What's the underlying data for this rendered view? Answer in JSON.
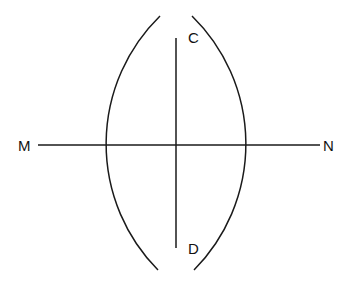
{
  "diagram": {
    "type": "geometric-construction",
    "line_endpoints": {
      "left_label": "M",
      "right_label": "N"
    },
    "arc_intersections": {
      "top_label": "C",
      "bottom_label": "D"
    },
    "colors": {
      "stroke": "#1a1a1a",
      "text": "#111111",
      "background": "#ffffff"
    }
  }
}
